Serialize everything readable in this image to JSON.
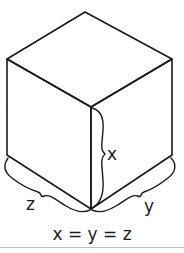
{
  "diagram": {
    "labels": {
      "height": "x",
      "depth_left": "z",
      "width_right": "y"
    },
    "caption": "x = y = z"
  }
}
